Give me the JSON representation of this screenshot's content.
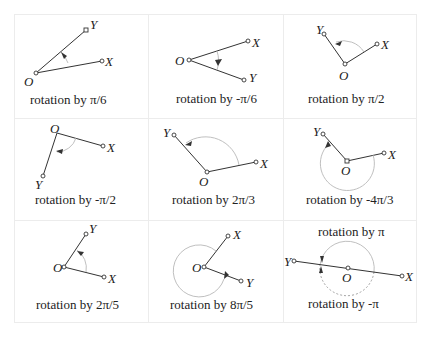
{
  "figure": {
    "grid": {
      "rows": 3,
      "cols": 3,
      "border_color": "#ececec"
    },
    "colors": {
      "line": "#333333",
      "arc": "#b8b8b8",
      "text": "#222222"
    },
    "panels": [
      {
        "caption": "rotation by  π/6",
        "labels": {
          "O": "O",
          "X": "X",
          "Y": "Y"
        }
      },
      {
        "caption": "rotation by -π/6",
        "labels": {
          "O": "O",
          "X": "X",
          "Y": "Y"
        }
      },
      {
        "caption": "rotation by π/2",
        "labels": {
          "O": "O",
          "X": "X",
          "Y": "Y"
        }
      },
      {
        "caption": "rotation by -π/2",
        "labels": {
          "O": "O",
          "X": "X",
          "Y": "Y"
        }
      },
      {
        "caption": "rotation by 2π/3",
        "labels": {
          "O": "O",
          "X": "X",
          "Y": "Y"
        }
      },
      {
        "caption": "rotation by -4π/3",
        "labels": {
          "O": "O",
          "X": "X",
          "Y": "Y"
        }
      },
      {
        "caption": "rotation by 2π/5",
        "labels": {
          "O": "O",
          "X": "X",
          "Y": "Y"
        }
      },
      {
        "caption": "rotation by 8π/5",
        "labels": {
          "O": "O",
          "X": "X",
          "Y": "Y"
        }
      },
      {
        "caption": "rotation by π",
        "caption2": "rotation by -π",
        "labels": {
          "O": "O",
          "X": "X",
          "Y": "Y"
        }
      }
    ]
  }
}
